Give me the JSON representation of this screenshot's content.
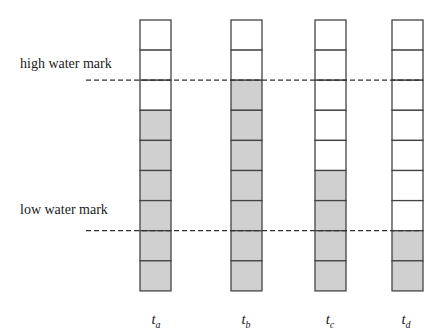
{
  "diagram": {
    "type": "buffer-level-columns",
    "cells_per_column": 9,
    "colors": {
      "filled": "#d0d0d0",
      "empty": "#ffffff",
      "stroke": "#444444",
      "dash": "#333333"
    },
    "marks": [
      {
        "id": "high",
        "label": "high water mark",
        "level_cells_from_bottom": 7
      },
      {
        "id": "low",
        "label": "low water mark",
        "level_cells_from_bottom": 2
      }
    ],
    "columns": [
      {
        "id": "a",
        "label_base": "t",
        "label_sub": "a",
        "filled_cells": 6
      },
      {
        "id": "b",
        "label_base": "t",
        "label_sub": "b",
        "filled_cells": 7
      },
      {
        "id": "c",
        "label_base": "t",
        "label_sub": "c",
        "filled_cells": 4
      },
      {
        "id": "d",
        "label_base": "t",
        "label_sub": "d",
        "filled_cells": 2
      }
    ]
  },
  "labels": {
    "high": "high water mark",
    "low": "low water mark",
    "ta_base": "t",
    "ta_sub": "a",
    "tb_base": "t",
    "tb_sub": "b",
    "tc_base": "t",
    "tc_sub": "c",
    "td_base": "t",
    "td_sub": "d"
  }
}
